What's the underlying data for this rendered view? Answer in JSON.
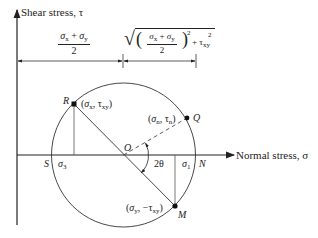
{
  "diagram": {
    "axes": {
      "y_label": "Shear stress, τ",
      "x_label": "Normal stress, σ"
    },
    "dimensions": {
      "center_offset": {
        "numerator": "σx + σy",
        "denominator": "2"
      },
      "radius": {
        "expression": "√(((σx + σy)/2)² + τxy²)",
        "numerator": "σx + σy",
        "denominator": "2",
        "exp": "2",
        "tau": "τ",
        "tau_sub": "xy",
        "tau_sup": "2",
        "plus": "+"
      }
    },
    "points": {
      "R": {
        "label": "R",
        "coords": "(σx, τxy)"
      },
      "Q": {
        "label": "Q",
        "coords": "(σn, τn)"
      },
      "M": {
        "label": "M",
        "coords": "(σy, −τxy)"
      },
      "O": {
        "label": "O"
      },
      "S": {
        "label": "S"
      },
      "N": {
        "label": "N"
      }
    },
    "principal": {
      "sigma3": "σ3",
      "sigma1": "σ1"
    },
    "angle": "2θ"
  }
}
